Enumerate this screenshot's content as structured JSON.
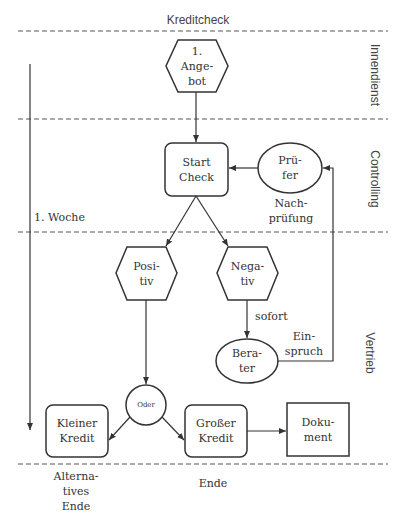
{
  "title": "Kreditcheck",
  "lanes": [
    {
      "label": "Innendienst"
    },
    {
      "label": "Controlling"
    },
    {
      "label": "Vertrieb"
    }
  ],
  "timeline": {
    "label": "1. Woche"
  },
  "nodes": {
    "angebot": {
      "shape": "hexagon",
      "line1": "1.",
      "line2": "Ange-",
      "line3": "bot"
    },
    "start_check": {
      "shape": "rounded-rect",
      "line1": "Start",
      "line2": "Check"
    },
    "pruefer": {
      "shape": "ellipse",
      "line1": "Prü-",
      "line2": "fer"
    },
    "positiv": {
      "shape": "hexagon",
      "line1": "Posi-",
      "line2": "tiv"
    },
    "negativ": {
      "shape": "hexagon",
      "line1": "Nega-",
      "line2": "tiv"
    },
    "berater": {
      "shape": "ellipse",
      "line1": "Bera-",
      "line2": "ter"
    },
    "oder": {
      "shape": "circle",
      "label": "Oder"
    },
    "kleiner_kredit": {
      "shape": "rounded-rect",
      "line1": "Kleiner",
      "line2": "Kredit"
    },
    "grosser_kredit": {
      "shape": "rounded-rect",
      "line1": "Großer",
      "line2": "Kredit"
    },
    "dokument": {
      "shape": "rect",
      "line1": "Doku-",
      "line2": "ment"
    }
  },
  "edge_labels": {
    "nachpruefung_1": "Nach-",
    "nachpruefung_2": "prüfung",
    "sofort": "sofort",
    "einspruch_1": "Ein-",
    "einspruch_2": "spruch"
  },
  "footer": {
    "alt_end_1": "Alterna-",
    "alt_end_2": "tives",
    "alt_end_3": "Ende",
    "end": "Ende"
  },
  "colors": {
    "stroke": "#333333",
    "dash": "#555555",
    "background": "#ffffff"
  }
}
